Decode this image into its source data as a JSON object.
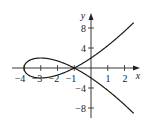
{
  "chart_data": {
    "type": "line",
    "title": "",
    "xlabel": "x",
    "ylabel": "y",
    "xlim": [
      -4.2,
      2.9
    ],
    "ylim": [
      -10,
      10.8
    ],
    "grid": false,
    "legend": null,
    "x_ticks": [
      -4,
      -3,
      -2,
      -1,
      1,
      2
    ],
    "x_tick_labels": [
      "−4",
      "−3",
      "−2",
      "−1",
      "1",
      "2"
    ],
    "y_ticks": [
      8,
      4,
      -4,
      -8
    ],
    "y_tick_labels": [
      "8",
      "4",
      "−4",
      "−8"
    ],
    "series": [
      {
        "name": "upper branch",
        "x": [
          -4,
          -3.5,
          -3,
          -2.5,
          -2,
          -1.5,
          -1,
          -0.5,
          0,
          0.5,
          1,
          1.5,
          2,
          2.55
        ],
        "y": [
          0,
          -1.06,
          -2,
          -2.37,
          -2.0,
          -1.06,
          0,
          1.06,
          2.0,
          3.54,
          4.47,
          5.7,
          7.35,
          8.9
        ]
      },
      {
        "name": "lower branch",
        "x": [
          -4,
          -3.5,
          -3,
          -2.5,
          -2,
          -1.5,
          -1,
          -0.5,
          0,
          0.5,
          1,
          1.5,
          2,
          2.55
        ],
        "y": [
          0,
          1.06,
          2,
          2.37,
          2.0,
          1.06,
          0,
          -1.06,
          -2.0,
          -3.54,
          -4.47,
          -5.7,
          -7.35,
          -8.9
        ]
      }
    ]
  },
  "labels": {
    "x_axis": "x",
    "y_axis": "y",
    "xt0": "−4",
    "xt1": "−3",
    "xt2": "−2",
    "xt3": "−1",
    "xt4": "1",
    "xt5": "2",
    "yt0": "8",
    "yt1": "4",
    "yt2": "−4",
    "yt3": "−8"
  }
}
